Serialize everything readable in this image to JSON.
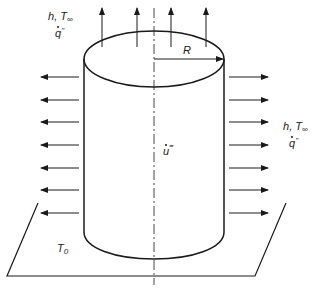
{
  "diagram": {
    "type": "cylinder-heat-transfer",
    "colors": {
      "stroke": "#1a1a1a",
      "background": "#ffffff"
    },
    "labels": {
      "top_left_h": "h",
      "top_left_T": "T",
      "top_left_T_sub": "∞",
      "top_left_q": "q",
      "top_left_q_sup": "\"",
      "right_h": "h",
      "right_T": "T",
      "right_T_sub": "∞",
      "right_q": "q",
      "right_q_sup": "\"",
      "radius": "R",
      "generation": "u",
      "generation_sup": "‴",
      "base_temp": "T",
      "base_temp_sub": "0"
    },
    "arrows": {
      "top_count": 4,
      "left_count": 7,
      "right_count": 7
    }
  }
}
